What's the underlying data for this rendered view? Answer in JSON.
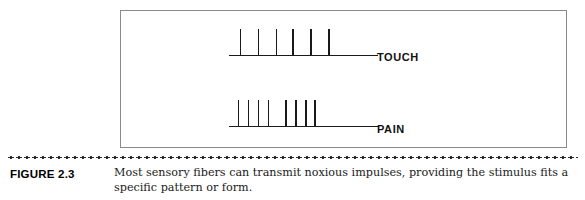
{
  "figure": {
    "number_label": "FIGURE 2.3",
    "caption": "Most sensory fibers can transmit noxious impulses, providing the stimulus fits a specific pattern or form."
  },
  "panel": {
    "border_color": "#8a8a8a",
    "background": "#ffffff"
  },
  "chart_data": {
    "type": "line",
    "title": "",
    "xlabel": "",
    "ylabel": "",
    "grid": false,
    "legend_position": "right-inline",
    "series": [
      {
        "name": "TOUCH",
        "label": "TOUCH",
        "baseline_y": 55,
        "baseline_x_start": 228,
        "baseline_x_end": 370,
        "spike_height": 27,
        "spike_width": 1.6,
        "spike_color": "#1a1a1a",
        "spike_count": 6,
        "spike_positions": [
          240,
          258,
          276,
          293,
          311,
          329
        ],
        "pattern": "regular",
        "spike_interval": 18
      },
      {
        "name": "PAIN",
        "label": "PAIN",
        "baseline_y": 127,
        "baseline_x_start": 228,
        "baseline_x_end": 370,
        "spike_height": 27,
        "spike_width": 1.6,
        "spike_color": "#1a1a1a",
        "spike_count": 8,
        "spike_positions": [
          238,
          248,
          258,
          268,
          286,
          296,
          306,
          315
        ],
        "pattern": "burst",
        "burst_groups": [
          [
            238,
            248,
            258,
            268
          ],
          [
            286,
            296,
            306,
            315
          ]
        ]
      }
    ],
    "baseline_color": "#1a1a1a",
    "baseline_width": 1.6
  }
}
